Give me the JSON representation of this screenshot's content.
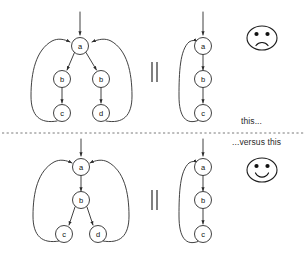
{
  "figure": {
    "width": 307,
    "height": 269,
    "background_color": "#ffffff",
    "stroke_color": "#2b2b2b",
    "divider": {
      "label": "horizontal-dashed-separator",
      "y": 133,
      "x_start": 2,
      "x_end": 305,
      "style": "dashed",
      "color": "#6b6b6b"
    }
  },
  "captions": {
    "upper": "this...",
    "lower": "...versus this"
  },
  "faces": [
    {
      "id": "sad-face",
      "expression": "sad",
      "cx": 262,
      "cy": 38,
      "rx": 15,
      "ry": 12,
      "applies_to": "upper-panel"
    },
    {
      "id": "happy-face",
      "expression": "happy",
      "cx": 262,
      "cy": 170,
      "rx": 15,
      "ry": 12,
      "applies_to": "lower-panel"
    }
  ],
  "panels": [
    {
      "id": "upper-panel",
      "verdict": "sad",
      "equals_sign": {
        "x": 155,
        "y_top": 62,
        "y_bottom": 82,
        "glyph": "=",
        "orientation": "rotated"
      },
      "graphs": [
        {
          "id": "upper-left-graph",
          "role": "expanded",
          "entry_arrow": {
            "x": 80,
            "y_start": 12,
            "y_end": 37
          },
          "nodes": [
            {
              "id": "a",
              "label": "a",
              "cx": 80,
              "cy": 46,
              "r": 8.5
            },
            {
              "id": "b1",
              "label": "b",
              "cx": 62,
              "cy": 79,
              "r": 8.5
            },
            {
              "id": "b2",
              "label": "b",
              "cx": 101,
              "cy": 79,
              "r": 8.5
            },
            {
              "id": "c",
              "label": "c",
              "cx": 62,
              "cy": 113,
              "r": 8.5
            },
            {
              "id": "d",
              "label": "d",
              "cx": 101,
              "cy": 113,
              "r": 8.5
            }
          ],
          "edges": [
            {
              "from": "a",
              "to": "b1",
              "kind": "straight"
            },
            {
              "from": "a",
              "to": "b2",
              "kind": "straight"
            },
            {
              "from": "b1",
              "to": "c",
              "kind": "straight"
            },
            {
              "from": "b2",
              "to": "d",
              "kind": "straight"
            },
            {
              "from": "c",
              "to": "a",
              "kind": "back-edge-left"
            },
            {
              "from": "d",
              "to": "a",
              "kind": "back-edge-right"
            }
          ]
        },
        {
          "id": "upper-right-graph",
          "role": "collapsed",
          "entry_arrow": {
            "x": 203,
            "y_start": 12,
            "y_end": 37
          },
          "nodes": [
            {
              "id": "a",
              "label": "a",
              "cx": 203,
              "cy": 46,
              "r": 8.5
            },
            {
              "id": "b",
              "label": "b",
              "cx": 203,
              "cy": 79,
              "r": 8.5
            },
            {
              "id": "c",
              "label": "c",
              "cx": 203,
              "cy": 113,
              "r": 8.5
            }
          ],
          "edges": [
            {
              "from": "a",
              "to": "b",
              "kind": "straight"
            },
            {
              "from": "b",
              "to": "c",
              "kind": "straight"
            },
            {
              "from": "c",
              "to": "a",
              "kind": "back-edge-left"
            }
          ]
        }
      ]
    },
    {
      "id": "lower-panel",
      "verdict": "happy",
      "equals_sign": {
        "x": 155,
        "y_top": 190,
        "y_bottom": 210,
        "glyph": "=",
        "orientation": "rotated"
      },
      "graphs": [
        {
          "id": "lower-left-graph",
          "role": "expanded",
          "entry_arrow": {
            "x": 81,
            "y_start": 143,
            "y_end": 158
          },
          "nodes": [
            {
              "id": "a",
              "label": "a",
              "cx": 81,
              "cy": 167,
              "r": 8.5
            },
            {
              "id": "b",
              "label": "b",
              "cx": 81,
              "cy": 200,
              "r": 8.5
            },
            {
              "id": "c",
              "label": "c",
              "cx": 64,
              "cy": 234,
              "r": 8.5
            },
            {
              "id": "d",
              "label": "d",
              "cx": 98,
              "cy": 234,
              "r": 8.5
            }
          ],
          "edges": [
            {
              "from": "a",
              "to": "b",
              "kind": "straight"
            },
            {
              "from": "b",
              "to": "c",
              "kind": "straight"
            },
            {
              "from": "b",
              "to": "d",
              "kind": "straight"
            },
            {
              "from": "c",
              "to": "a",
              "kind": "back-edge-left"
            },
            {
              "from": "d",
              "to": "a",
              "kind": "back-edge-right"
            }
          ]
        },
        {
          "id": "lower-right-graph",
          "role": "collapsed",
          "entry_arrow": {
            "x": 203,
            "y_start": 143,
            "y_end": 158
          },
          "nodes": [
            {
              "id": "a",
              "label": "a",
              "cx": 203,
              "cy": 167,
              "r": 8.5
            },
            {
              "id": "b",
              "label": "b",
              "cx": 203,
              "cy": 200,
              "r": 8.5
            },
            {
              "id": "c",
              "label": "c",
              "cx": 203,
              "cy": 234,
              "r": 8.5
            }
          ],
          "edges": [
            {
              "from": "a",
              "to": "b",
              "kind": "straight"
            },
            {
              "from": "b",
              "to": "c",
              "kind": "straight"
            },
            {
              "from": "c",
              "to": "a",
              "kind": "back-edge-left"
            }
          ]
        }
      ]
    }
  ],
  "node_labels": {
    "upper_left": [
      "a",
      "b",
      "b",
      "c",
      "d"
    ],
    "upper_right": [
      "a",
      "b",
      "c"
    ],
    "lower_left": [
      "a",
      "b",
      "c",
      "d"
    ],
    "lower_right": [
      "a",
      "b",
      "c"
    ]
  }
}
